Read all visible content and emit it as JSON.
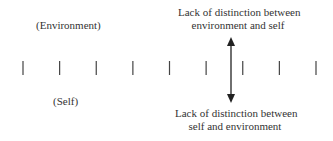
{
  "diagram": {
    "labels": {
      "environment": "(Environment)",
      "self": "(Self)",
      "top_line1": "Lack of distinction between",
      "top_line2": "environment and self",
      "bottom_line1": "Lack of distinction between",
      "bottom_line2": "self and environment"
    },
    "tick_count": 9,
    "arrow": {
      "type": "double-headed",
      "position_between_ticks": [
        6,
        7
      ]
    },
    "colors": {
      "stroke": "#333333",
      "text": "#333333"
    }
  }
}
